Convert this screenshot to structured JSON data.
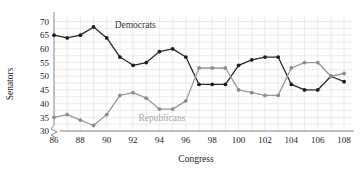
{
  "chart_data": {
    "type": "line",
    "title": "",
    "xlabel": "Congress",
    "ylabel": "Senators",
    "xlim": [
      86,
      108.6
    ],
    "ylim": [
      30,
      72
    ],
    "grid": true,
    "legend_position": "inline-annotations",
    "x": [
      86,
      87,
      88,
      89,
      90,
      91,
      92,
      93,
      94,
      95,
      96,
      97,
      98,
      99,
      100,
      101,
      102,
      103,
      104,
      105,
      106,
      107,
      108
    ],
    "xticks": [
      86,
      88,
      90,
      92,
      94,
      96,
      98,
      100,
      102,
      104,
      106,
      108
    ],
    "yticks": [
      30,
      35,
      40,
      45,
      50,
      55,
      60,
      65,
      70
    ],
    "axis_break": true,
    "series": [
      {
        "name": "Democrats",
        "color": "#201e1c",
        "values": [
          65,
          64,
          65,
          68,
          64,
          57,
          54,
          55,
          59,
          60,
          57,
          47,
          47,
          47,
          54,
          56,
          57,
          57,
          47,
          45,
          45,
          50,
          48
        ]
      },
      {
        "name": "Republicans",
        "color": "#8f8d8b",
        "values": [
          35,
          36,
          34,
          32,
          36,
          43,
          44,
          42,
          38,
          38,
          41,
          53,
          53,
          53,
          45,
          44,
          43,
          43,
          53,
          55,
          55,
          50,
          51
        ]
      }
    ],
    "annotations": [
      {
        "text": "Democrats",
        "x": 90.6,
        "y": 67.5
      },
      {
        "text": "Republicans",
        "x": 92.4,
        "y": 33.6
      }
    ]
  }
}
